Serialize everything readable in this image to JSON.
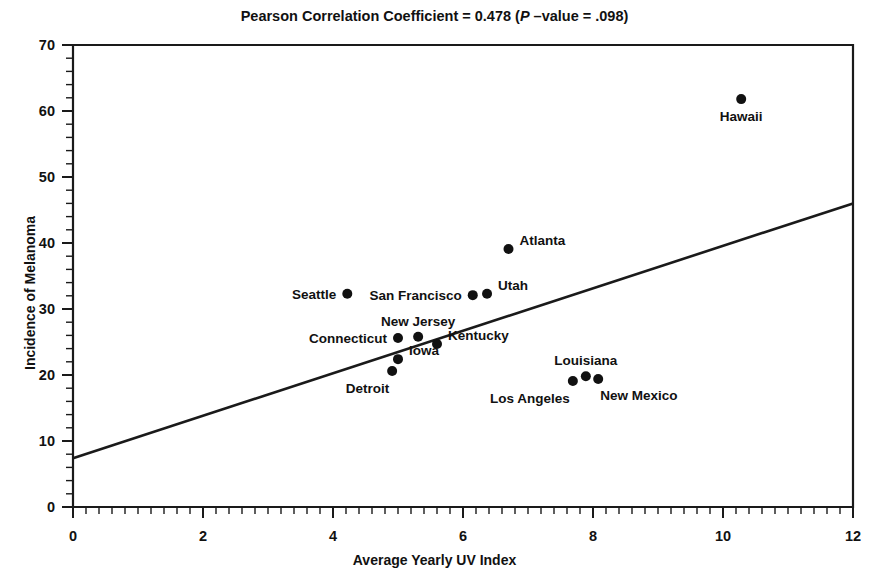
{
  "chart_data": {
    "type": "scatter",
    "title": "Pearson Correlation Coefficient = 0.478 (P –value = .098)",
    "title_parts": {
      "before": "Pearson Correlation Coefficient = 0.478 (",
      "italic": "P",
      "after": " –value = .098)"
    },
    "xlabel": "Average Yearly UV Index",
    "ylabel": "Incidence of Melanoma",
    "xlim": [
      0,
      12
    ],
    "ylim": [
      0,
      70
    ],
    "xticks": [
      0,
      2,
      4,
      6,
      8,
      10,
      12
    ],
    "yticks": [
      0,
      10,
      20,
      30,
      40,
      50,
      60,
      70
    ],
    "xtick_labels": [
      "0",
      "2",
      "4",
      "6",
      "8",
      "10",
      "12"
    ],
    "ytick_labels": [
      "0",
      "10",
      "20",
      "30",
      "40",
      "50",
      "60",
      "70"
    ],
    "x_minor_step": 0.2,
    "y_minor_step": 2,
    "grid": false,
    "legend": false,
    "marker": "filled-circle",
    "points": [
      {
        "label": "Hawaii",
        "x": 10.28,
        "y": 61.8,
        "label_pos": "below"
      },
      {
        "label": "Atlanta",
        "x": 6.7,
        "y": 39.1,
        "label_pos": "right"
      },
      {
        "label": "Seattle",
        "x": 4.22,
        "y": 32.3,
        "label_pos": "left"
      },
      {
        "label": "San Francisco",
        "x": 6.15,
        "y": 32.1,
        "label_pos": "left"
      },
      {
        "label": "Utah",
        "x": 6.37,
        "y": 32.3,
        "label_pos": "right"
      },
      {
        "label": "Connecticut",
        "x": 5.0,
        "y": 25.6,
        "label_pos": "left"
      },
      {
        "label": "New Jersey",
        "x": 5.31,
        "y": 25.8,
        "label_pos": "above"
      },
      {
        "label": "Kentucky",
        "x": 5.6,
        "y": 24.7,
        "label_pos": "right"
      },
      {
        "label": "Iowa",
        "x": 5.0,
        "y": 22.4,
        "label_pos": "right"
      },
      {
        "label": "Detroit",
        "x": 4.91,
        "y": 20.6,
        "label_pos": "below-left"
      },
      {
        "label": "Los Angeles",
        "x": 7.69,
        "y": 19.1,
        "label_pos": "below-left"
      },
      {
        "label": "Louisiana",
        "x": 7.89,
        "y": 19.8,
        "label_pos": "above"
      },
      {
        "label": "New Mexico",
        "x": 8.08,
        "y": 19.4,
        "label_pos": "below-right"
      }
    ],
    "fit_line": {
      "type": "linear-regression",
      "x_start": 0,
      "y_start": 7.4,
      "x_end": 12,
      "y_end": 46.0
    },
    "statistics": {
      "pearson_r": 0.478,
      "p_value": 0.098
    }
  },
  "colors": {
    "ink": "#111111",
    "axis": "#1a1a1a",
    "background": "#ffffff"
  }
}
